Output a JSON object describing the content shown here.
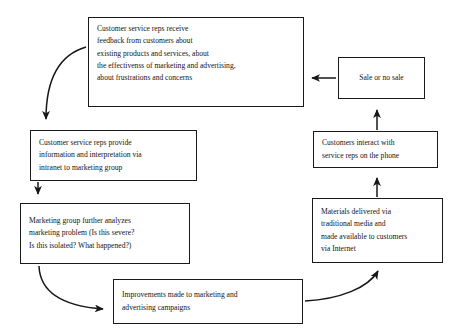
{
  "diagram": {
    "background_color": "#ffffff",
    "line_color": "#171717",
    "text_color": "#141414",
    "nodes": [
      {
        "id": "feedback_received",
        "label": "Customer service reps receive\nfeedback from customers about\nexisting products and services, about\nthe effectivenss of marketing and advertising,\nabout frustrations and concerns",
        "x": 88,
        "y": 17,
        "w": 216,
        "h": 90,
        "align": "left"
      },
      {
        "id": "sale_or_no_sale",
        "label": "Sale or no sale",
        "x": 338,
        "y": 57,
        "w": 87,
        "h": 42,
        "align": "center"
      },
      {
        "id": "customers_interact",
        "label": "Customers interact with\nservice reps on the phone",
        "x": 313,
        "y": 131,
        "w": 125,
        "h": 37,
        "align": "left"
      },
      {
        "id": "reps_provide_info",
        "label": "Customer service reps provide\ninformation and interpretation via\nintranet to marketing group",
        "x": 30,
        "y": 130,
        "w": 167,
        "h": 51,
        "align": "left"
      },
      {
        "id": "materials_delivered",
        "label": "Materials delivered via\ntraditional media and\nmade available to customers\nvia Internet",
        "x": 312,
        "y": 198,
        "w": 131,
        "h": 65,
        "align": "left"
      },
      {
        "id": "marketing_analyzes",
        "label": "Marketing group further analyzes\nmarketing problem (Is this severe?\nIs this isolated? What happened?)",
        "x": 20,
        "y": 203,
        "w": 170,
        "h": 61,
        "align": "left"
      },
      {
        "id": "improvements_made",
        "label": "Improvements made to marketing and\nadvertising campaigns",
        "x": 113,
        "y": 279,
        "w": 190,
        "h": 45,
        "align": "left"
      }
    ],
    "edges": [
      {
        "id": "sale-to-feedback",
        "from": "sale_or_no_sale",
        "to": "feedback_received",
        "shape": "straight-left"
      },
      {
        "id": "feedback-to-reps-provide",
        "from": "feedback_received",
        "to": "reps_provide_info",
        "shape": "curve-down-left"
      },
      {
        "id": "reps-provide-to-analyzes",
        "from": "reps_provide_info",
        "to": "marketing_analyzes",
        "shape": "straight-down"
      },
      {
        "id": "analyzes-to-improvements",
        "from": "marketing_analyzes",
        "to": "improvements_made",
        "shape": "curve-down-right"
      },
      {
        "id": "improvements-to-materials",
        "from": "improvements_made",
        "to": "materials_delivered",
        "shape": "curve-up-right"
      },
      {
        "id": "materials-to-customers-interact",
        "from": "materials_delivered",
        "to": "customers_interact",
        "shape": "straight-up"
      },
      {
        "id": "customers-interact-to-sale",
        "from": "customers_interact",
        "to": "sale_or_no_sale",
        "shape": "straight-up"
      }
    ]
  }
}
